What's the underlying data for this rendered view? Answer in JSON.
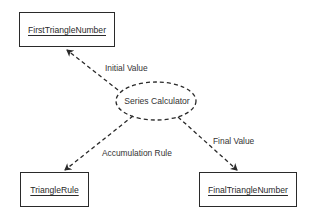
{
  "diagram": {
    "nodes": {
      "center": {
        "label": "Series Calculator",
        "shape": "dashed-ellipse"
      },
      "first": {
        "label": "FirstTriangleNumber",
        "shape": "box"
      },
      "rule": {
        "label": "TriangleRule",
        "shape": "box"
      },
      "final": {
        "label": "FinalTriangleNumber",
        "shape": "box"
      }
    },
    "edges": [
      {
        "from": "center",
        "to": "first",
        "label": "Initial Value",
        "style": "dashed-arrow"
      },
      {
        "from": "center",
        "to": "rule",
        "label": "Accumulation Rule",
        "style": "dashed-arrow"
      },
      {
        "from": "center",
        "to": "final",
        "label": "Final Value",
        "style": "dashed-arrow"
      }
    ],
    "colors": {
      "stroke": "#2a2a2a",
      "background": "#ffffff"
    }
  }
}
